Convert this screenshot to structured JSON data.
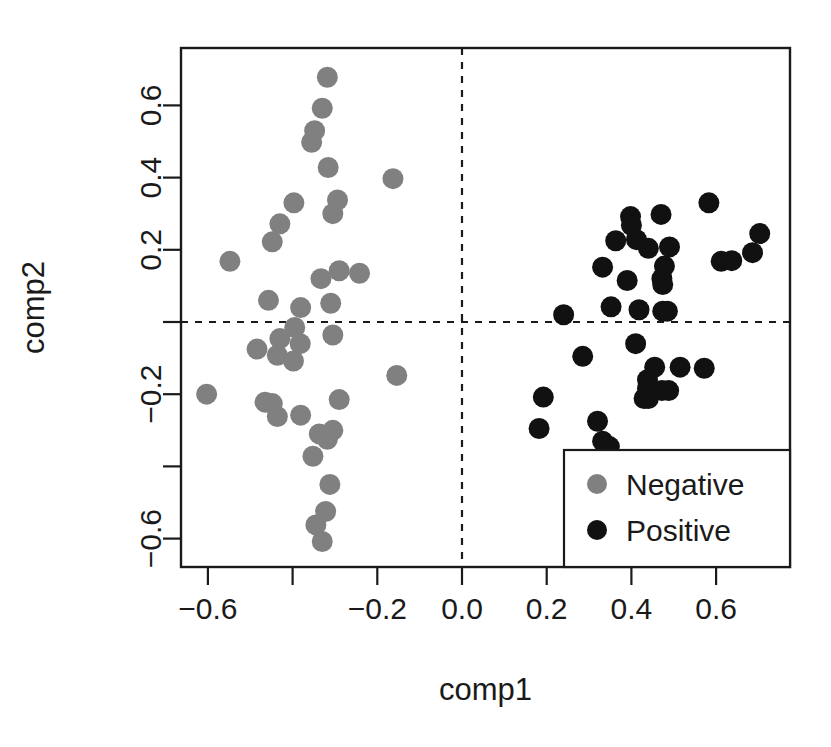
{
  "chart_data": {
    "type": "scatter",
    "title": "",
    "xlabel": "comp1",
    "ylabel": "comp2",
    "xlim": [
      -0.655,
      0.74
    ],
    "ylim": [
      -0.675,
      0.745
    ],
    "grid": false,
    "xticks": [
      -0.6,
      -0.4,
      -0.2,
      0.0,
      0.2,
      0.4,
      0.6
    ],
    "xticklabels": [
      "-0.6",
      "",
      "-0.2",
      "0.0",
      "0.2",
      "0.4",
      "0.6"
    ],
    "yticks": [
      0.6,
      0.4,
      0.2,
      0.0,
      -0.2,
      -0.4,
      -0.6
    ],
    "yticklabels": [
      "0.6",
      "0.4",
      "0.2",
      "",
      "-0.2",
      "",
      "-0.6"
    ],
    "reference_lines": [
      {
        "orientation": "vertical",
        "value": 0.0,
        "style": "dashed"
      },
      {
        "orientation": "horizontal",
        "value": 0.0,
        "style": "dashed"
      }
    ],
    "legend": {
      "position": "bottom-right",
      "entries": [
        {
          "label": "Negative",
          "color": "#808080",
          "marker": "circle"
        },
        {
          "label": "Positive",
          "color": "#111111",
          "marker": "circle"
        }
      ]
    },
    "series": [
      {
        "name": "Negative",
        "color": "#808080",
        "marker": "filled-circle",
        "points": [
          [
            -0.318,
            0.678
          ],
          [
            -0.33,
            0.592
          ],
          [
            -0.348,
            0.53
          ],
          [
            -0.355,
            0.498
          ],
          [
            -0.316,
            0.428
          ],
          [
            -0.163,
            0.397
          ],
          [
            -0.397,
            0.33
          ],
          [
            -0.294,
            0.338
          ],
          [
            -0.305,
            0.3
          ],
          [
            -0.43,
            0.272
          ],
          [
            -0.448,
            0.222
          ],
          [
            -0.548,
            0.168
          ],
          [
            -0.29,
            0.142
          ],
          [
            -0.242,
            0.135
          ],
          [
            -0.333,
            0.12
          ],
          [
            -0.457,
            0.06
          ],
          [
            -0.381,
            0.04
          ],
          [
            -0.31,
            0.052
          ],
          [
            -0.395,
            -0.015
          ],
          [
            -0.43,
            -0.046
          ],
          [
            -0.382,
            -0.06
          ],
          [
            -0.305,
            -0.036
          ],
          [
            -0.484,
            -0.075
          ],
          [
            -0.436,
            -0.092
          ],
          [
            -0.398,
            -0.108
          ],
          [
            -0.154,
            -0.148
          ],
          [
            -0.603,
            -0.2
          ],
          [
            -0.465,
            -0.222
          ],
          [
            -0.448,
            -0.226
          ],
          [
            -0.29,
            -0.215
          ],
          [
            -0.436,
            -0.262
          ],
          [
            -0.381,
            -0.258
          ],
          [
            -0.337,
            -0.31
          ],
          [
            -0.318,
            -0.325
          ],
          [
            -0.305,
            -0.3
          ],
          [
            -0.352,
            -0.372
          ],
          [
            -0.312,
            -0.45
          ],
          [
            -0.322,
            -0.525
          ],
          [
            -0.345,
            -0.562
          ],
          [
            -0.33,
            -0.608
          ]
        ]
      },
      {
        "name": "Positive",
        "color": "#111111",
        "marker": "filled-circle",
        "points": [
          [
            0.583,
            0.33
          ],
          [
            0.47,
            0.298
          ],
          [
            0.398,
            0.292
          ],
          [
            0.4,
            0.268
          ],
          [
            0.703,
            0.245
          ],
          [
            0.363,
            0.225
          ],
          [
            0.412,
            0.228
          ],
          [
            0.44,
            0.204
          ],
          [
            0.49,
            0.208
          ],
          [
            0.686,
            0.192
          ],
          [
            0.612,
            0.168
          ],
          [
            0.637,
            0.17
          ],
          [
            0.332,
            0.152
          ],
          [
            0.478,
            0.155
          ],
          [
            0.472,
            0.12
          ],
          [
            0.474,
            0.104
          ],
          [
            0.39,
            0.115
          ],
          [
            0.352,
            0.042
          ],
          [
            0.418,
            0.034
          ],
          [
            0.474,
            0.03
          ],
          [
            0.485,
            0.03
          ],
          [
            0.24,
            0.02
          ],
          [
            0.41,
            -0.06
          ],
          [
            0.285,
            -0.095
          ],
          [
            0.455,
            -0.125
          ],
          [
            0.515,
            -0.125
          ],
          [
            0.572,
            -0.128
          ],
          [
            0.438,
            -0.16
          ],
          [
            0.438,
            -0.185
          ],
          [
            0.472,
            -0.19
          ],
          [
            0.488,
            -0.19
          ],
          [
            0.43,
            -0.212
          ],
          [
            0.44,
            -0.212
          ],
          [
            0.192,
            -0.208
          ],
          [
            0.182,
            -0.295
          ],
          [
            0.32,
            -0.275
          ],
          [
            0.332,
            -0.33
          ],
          [
            0.348,
            -0.345
          ]
        ]
      }
    ]
  }
}
